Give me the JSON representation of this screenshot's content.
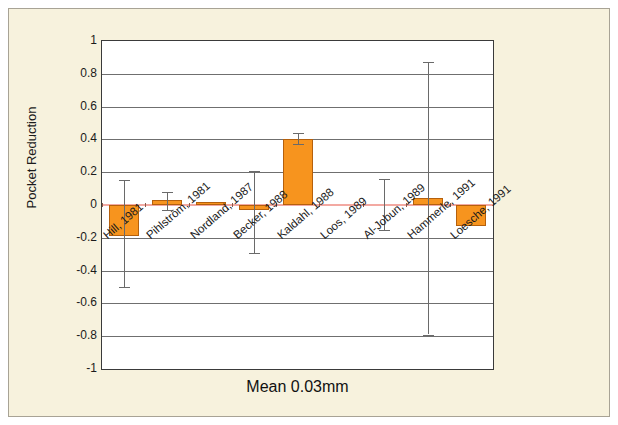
{
  "chart_data": {
    "type": "bar",
    "title": "",
    "footer_label": "Mean  0.03mm",
    "xlabel": "",
    "ylabel": "Pocket Reduction",
    "ylim": [
      -1,
      1
    ],
    "ytick_labels": [
      "1",
      "0.8",
      "0.6",
      "0.4",
      "0.2",
      "0",
      "-0.2",
      "-0.4",
      "-0.6",
      "-0.8",
      "-1"
    ],
    "ytick_values": [
      1,
      0.8,
      0.6,
      0.4,
      0.2,
      0,
      -0.2,
      -0.4,
      -0.6,
      -0.8,
      -1
    ],
    "grid": true,
    "legend": false,
    "zero_line": true,
    "categories": [
      "Hill, 1981",
      "Pihlström, 1981",
      "Nordland, 1987",
      "Becker, 1988",
      "Kaldahl, 1988",
      "Loos, 1989",
      "Al-Jobun, 1989",
      "Hammerle, 1991",
      "Loesche, 1991"
    ],
    "values": [
      -0.19,
      0.03,
      0.02,
      -0.03,
      0.4,
      0.0,
      0.0,
      0.045,
      -0.13
    ],
    "error_upper": [
      0.15,
      0.08,
      null,
      0.21,
      0.44,
      null,
      0.16,
      0.87,
      null
    ],
    "error_lower": [
      -0.5,
      -0.03,
      null,
      -0.29,
      0.37,
      null,
      -0.15,
      -0.79,
      null
    ],
    "bar_color": "#f7941e",
    "bar_edge_color": "#b5600c",
    "error_color": "#6a6a6a",
    "zero_line_color": "#f3a9a2",
    "grid_color": "#6f6f6f",
    "plot_background": "#ffffff",
    "figure_background": "#f7f2dd"
  }
}
